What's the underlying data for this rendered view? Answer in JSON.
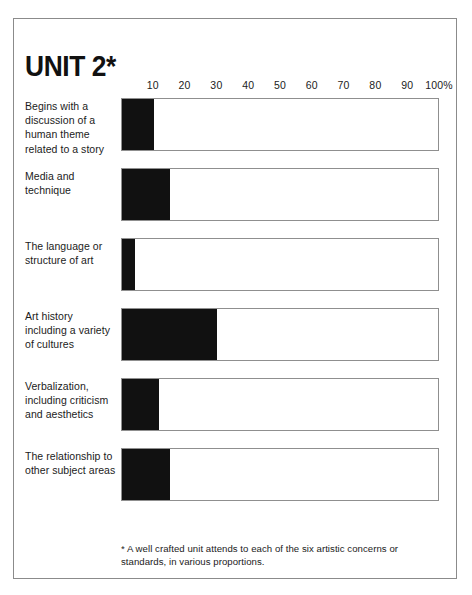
{
  "page": {
    "title": "UNIT 2*",
    "footnote": "* A well crafted unit attends to each of the six artistic concerns or standards, in various proportions.",
    "border_color": "#8b8b8b",
    "bar_color": "#111111",
    "track_border_color": "#8f8f8f"
  },
  "chart_data": {
    "type": "bar",
    "orientation": "horizontal",
    "title": "UNIT 2*",
    "xlabel": "",
    "ylabel": "",
    "xlim": [
      0,
      100
    ],
    "grid": false,
    "legend": null,
    "unit": "%",
    "axis_ticks": [
      {
        "label": "10",
        "value": 10
      },
      {
        "label": "20",
        "value": 20
      },
      {
        "label": "30",
        "value": 30
      },
      {
        "label": "40",
        "value": 40
      },
      {
        "label": "50",
        "value": 50
      },
      {
        "label": "60",
        "value": 60
      },
      {
        "label": "70",
        "value": 70
      },
      {
        "label": "80",
        "value": 80
      },
      {
        "label": "90",
        "value": 90
      },
      {
        "label": "100%",
        "value": 100
      }
    ],
    "categories": [
      "Begins with a discussion of a human theme related to a story",
      "Media and technique",
      "The language or structure of art",
      "Art history including a variety of cultures",
      "Verbalization, including criticism and aesthetics",
      "The relationship to other subject areas"
    ],
    "values": [
      10,
      15,
      4,
      30,
      11.5,
      15
    ]
  },
  "rows": [
    {
      "label": "Begins with a discussion of a human theme related to a story",
      "value": 10
    },
    {
      "label": "Media and technique",
      "value": 15
    },
    {
      "label": "The language or structure of art",
      "value": 4
    },
    {
      "label": "Art history including a variety of cultures",
      "value": 30
    },
    {
      "label": "Verbalization, including criticism and aesthetics",
      "value": 11.5
    },
    {
      "label": "The relationship to other subject areas",
      "value": 15
    }
  ]
}
